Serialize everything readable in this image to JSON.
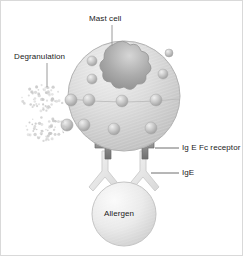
{
  "figure": {
    "background": "#ffffff",
    "border_color": "#d9d9d9"
  },
  "labels": {
    "mast_cell": "Mast cell",
    "degranulation": "Degranulation",
    "ige_fc_receptor": "Ig E Fc receptor",
    "ige": "IgE",
    "allergen": "Allergen"
  },
  "colors": {
    "cell_fill": "#d8d8d8",
    "cell_edge": "#b4b4b4",
    "nucleus_fill": "#a8a8a8",
    "granule_fill": "#bdbdbd",
    "receptor_fill": "#8a8a8a",
    "antibody_fill": "#e6e6e6",
    "allergen_fill": "#e4e4e4",
    "particle_fill": "#c8c8c8",
    "label_text": "#1a1a1a",
    "leader_line": "#9a9a9a"
  },
  "elements": {
    "cell": {
      "cx": 123,
      "cy": 95,
      "rx": 56,
      "ry": 55
    },
    "nucleus": {
      "cx": 125,
      "cy": 61,
      "r": 21,
      "lobes": 6
    },
    "allergen": {
      "cx": 123,
      "cy": 213,
      "r": 32
    },
    "granules": [
      {
        "cx": 91,
        "cy": 60,
        "r": 5
      },
      {
        "cx": 91,
        "cy": 78,
        "r": 5
      },
      {
        "cx": 88,
        "cy": 99,
        "r": 6
      },
      {
        "cx": 83,
        "cy": 124,
        "r": 6
      },
      {
        "cx": 121,
        "cy": 100,
        "r": 6
      },
      {
        "cx": 113,
        "cy": 128,
        "r": 6
      },
      {
        "cx": 150,
        "cy": 127,
        "r": 6
      },
      {
        "cx": 155,
        "cy": 99,
        "r": 6
      },
      {
        "cx": 162,
        "cy": 73,
        "r": 5
      },
      {
        "cx": 168,
        "cy": 52,
        "r": 4
      }
    ],
    "receptors": [
      {
        "x": 99,
        "y": 142
      },
      {
        "x": 135,
        "y": 142
      }
    ],
    "antibodies": [
      {
        "x": 99,
        "y": 150
      },
      {
        "x": 137,
        "y": 150
      }
    ],
    "particle_clusters": [
      {
        "cx": 42,
        "cy": 97,
        "count": 62,
        "spread_x": 22,
        "spread_y": 13
      },
      {
        "cx": 44,
        "cy": 128,
        "count": 58,
        "spread_x": 22,
        "spread_y": 12
      }
    ],
    "leaders": [
      {
        "name": "mast-cell-leader",
        "x1": 111,
        "y1": 24,
        "x2": 111,
        "y2": 45
      },
      {
        "name": "degranulation-leader",
        "x1": 46,
        "y1": 62,
        "x2": 46,
        "y2": 86
      },
      {
        "name": "receptor-leader",
        "x1": 155,
        "y1": 147,
        "x2": 178,
        "y2": 147
      },
      {
        "name": "ige-leader",
        "x1": 150,
        "y1": 172,
        "x2": 178,
        "y2": 172
      }
    ]
  }
}
